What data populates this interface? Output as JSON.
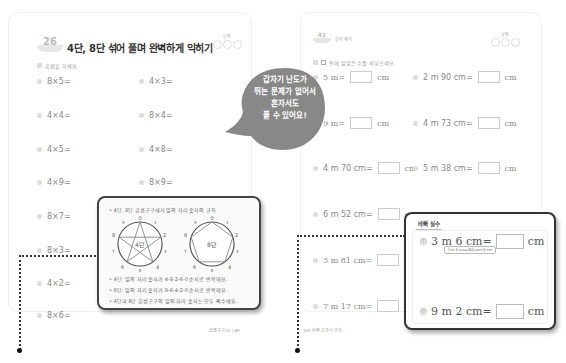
{
  "left_page": {
    "unit_number": "26",
    "title": "4단, 8단 섞어 풀며 완벽하게 익히기",
    "progress_label": "날짜",
    "instruction": "곱셈을 하세요.",
    "problems": [
      {
        "id": 1,
        "text": "8×5="
      },
      {
        "id": 2,
        "text": "4×3="
      },
      {
        "id": 3,
        "text": "4×4="
      },
      {
        "id": 4,
        "text": "8×4="
      },
      {
        "id": 5,
        "text": "4×5="
      },
      {
        "id": 6,
        "text": "4×8="
      },
      {
        "id": 7,
        "text": "4×9="
      },
      {
        "id": 8,
        "text": "8×9="
      },
      {
        "id": 9,
        "text": "8×7="
      },
      {
        "id": 10,
        "text": "8×3="
      },
      {
        "id": 11,
        "text": "4×2="
      },
      {
        "id": 12,
        "text": "8×6="
      }
    ],
    "footer": "곱셈구구(2) | 89"
  },
  "speech_bubble": {
    "lines": [
      "갑자기 난도가",
      "뛰는 문제가 없어서",
      "혼자서도",
      "풀 수 있어요!"
    ],
    "color": "#888888"
  },
  "rule_box": {
    "heading": "• 4단, 8단 곱셈구구에서 일의 자리 숫자의 규칙",
    "dial_left_label": "4단",
    "dial_right_label": "8단",
    "dial_digits": [
      "0",
      "1",
      "2",
      "3",
      "4",
      "5",
      "6",
      "7",
      "8",
      "9"
    ],
    "lines": [
      "• 4단: 일의 자리 숫자가 4-8-2-6-0 순서로 반복돼요.",
      "• 8단: 일의 자리 숫자가 8-6-4-2-0 순서로 반복돼요.",
      "• 4단과 8단 곱셈구구의 일의 자리 숫자는 모두 짝수예요."
    ]
  },
  "right_page": {
    "unit_number": "41",
    "section_label": "길이 재기",
    "progress_label": "날짜",
    "instruction": "안에 알맞은 수를 써넣으세요.",
    "unit_suffix": "cm",
    "problems": [
      {
        "id": 1,
        "text": "5 m="
      },
      {
        "id": 2,
        "text": "2 m 90 cm="
      },
      {
        "id": 3,
        "text": "9 m="
      },
      {
        "id": 4,
        "text": "4 m 73 cm="
      },
      {
        "id": 5,
        "text": "4 m 70 cm="
      },
      {
        "id": 6,
        "text": "5 m 38 cm="
      },
      {
        "id": 7,
        "text": "6 m 52 cm="
      },
      {
        "id": 8,
        "text": "3 m 81 cm="
      },
      {
        "id": 9,
        "text": "7 m 17 cm="
      }
    ],
    "footer": "104 바빠 교과서 연산"
  },
  "tip_box": {
    "title": "바빠 실수",
    "problems": [
      {
        "number": "11",
        "text": "3 m 6 cm=",
        "suffix": "cm"
      },
      {
        "number": "12",
        "text": "9 m 2 cm=",
        "suffix": "cm"
      }
    ],
    "hint": "3 m 6 cm=300 cm+6 cm"
  }
}
